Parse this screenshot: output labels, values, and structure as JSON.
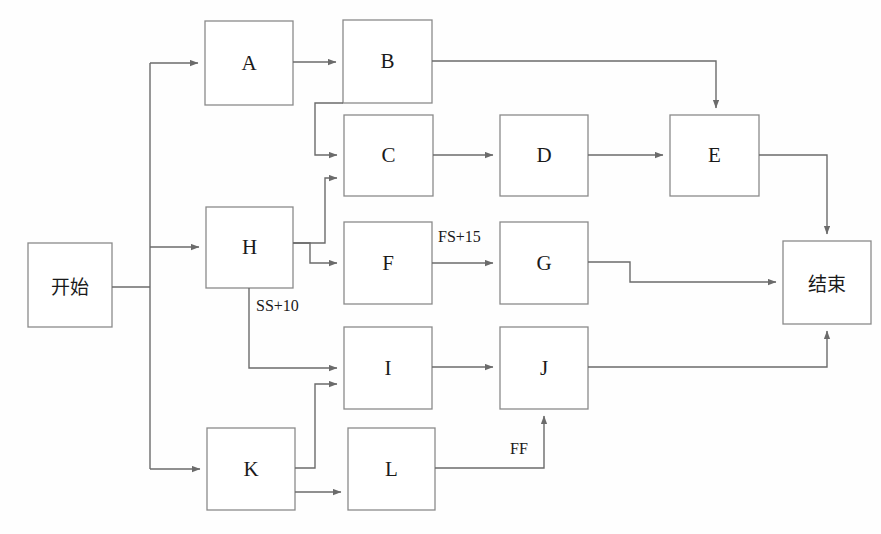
{
  "diagram": {
    "type": "project-network-diagram",
    "title": "",
    "background_color": "#fefefe",
    "line_color": "#6b6b6b",
    "box_border_color": "#8a8a8a",
    "text_color": "#1a1a1a",
    "nodes": [
      {
        "id": "start",
        "label": "开始",
        "script": "cjk",
        "x": 28,
        "y": 243,
        "w": 84,
        "h": 84
      },
      {
        "id": "A",
        "label": "A",
        "script": "latin",
        "x": 205,
        "y": 21,
        "w": 88,
        "h": 84
      },
      {
        "id": "B",
        "label": "B",
        "script": "latin",
        "x": 343,
        "y": 20,
        "w": 89,
        "h": 83
      },
      {
        "id": "C",
        "label": "C",
        "script": "latin",
        "x": 344,
        "y": 115,
        "w": 89,
        "h": 81
      },
      {
        "id": "D",
        "label": "D",
        "script": "latin",
        "x": 500,
        "y": 115,
        "w": 88,
        "h": 81
      },
      {
        "id": "E",
        "label": "E",
        "script": "latin",
        "x": 670,
        "y": 115,
        "w": 89,
        "h": 81
      },
      {
        "id": "H",
        "label": "H",
        "script": "latin",
        "x": 206,
        "y": 207,
        "w": 87,
        "h": 81
      },
      {
        "id": "F",
        "label": "F",
        "script": "latin",
        "x": 344,
        "y": 222,
        "w": 88,
        "h": 82
      },
      {
        "id": "G",
        "label": "G",
        "script": "latin",
        "x": 500,
        "y": 222,
        "w": 88,
        "h": 82
      },
      {
        "id": "end",
        "label": "结束",
        "script": "cjk",
        "x": 783,
        "y": 241,
        "w": 88,
        "h": 83
      },
      {
        "id": "I",
        "label": "I",
        "script": "latin",
        "x": 344,
        "y": 327,
        "w": 88,
        "h": 82
      },
      {
        "id": "J",
        "label": "J",
        "script": "latin",
        "x": 500,
        "y": 327,
        "w": 88,
        "h": 82
      },
      {
        "id": "K",
        "label": "K",
        "script": "latin",
        "x": 207,
        "y": 428,
        "w": 88,
        "h": 82
      },
      {
        "id": "L",
        "label": "L",
        "script": "latin",
        "x": 348,
        "y": 428,
        "w": 87,
        "h": 82
      }
    ],
    "edges": [
      {
        "from": "start",
        "to": "A",
        "label": ""
      },
      {
        "from": "start",
        "to": "H",
        "label": ""
      },
      {
        "from": "start",
        "to": "K",
        "label": ""
      },
      {
        "from": "A",
        "to": "B",
        "label": ""
      },
      {
        "from": "B",
        "to": "C",
        "label": ""
      },
      {
        "from": "B",
        "to": "E",
        "label": ""
      },
      {
        "from": "C",
        "to": "D",
        "label": ""
      },
      {
        "from": "D",
        "to": "E",
        "label": ""
      },
      {
        "from": "H",
        "to": "C",
        "label": ""
      },
      {
        "from": "H",
        "to": "F",
        "label": ""
      },
      {
        "from": "H",
        "to": "I",
        "label": "SS+10"
      },
      {
        "from": "F",
        "to": "G",
        "label": "FS+15"
      },
      {
        "from": "E",
        "to": "end",
        "label": ""
      },
      {
        "from": "G",
        "to": "end",
        "label": ""
      },
      {
        "from": "I",
        "to": "J",
        "label": ""
      },
      {
        "from": "J",
        "to": "end",
        "label": ""
      },
      {
        "from": "K",
        "to": "I",
        "label": ""
      },
      {
        "from": "K",
        "to": "L",
        "label": ""
      },
      {
        "from": "L",
        "to": "J",
        "label": "FF"
      }
    ],
    "edge_labels": [
      {
        "id": "fs15",
        "text": "FS+15",
        "x": 438,
        "y": 228
      },
      {
        "id": "ss10",
        "text": "SS+10",
        "x": 256,
        "y": 297
      },
      {
        "id": "ff",
        "text": "FF",
        "x": 510,
        "y": 440
      }
    ]
  }
}
